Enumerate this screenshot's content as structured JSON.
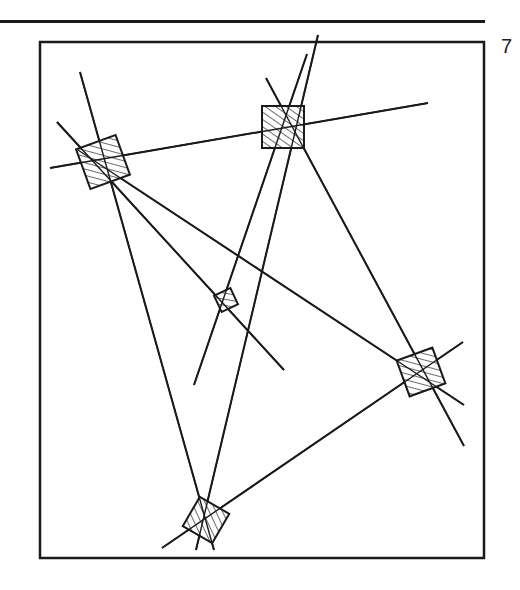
{
  "figure": {
    "number": "7",
    "frame": {
      "x": 40,
      "y": 42,
      "width": 444,
      "height": 516
    },
    "colors": {
      "ink": "#1a1a1a",
      "paper": "#ffffff"
    },
    "nodes": [
      {
        "id": "top-left",
        "cx": 103,
        "cy": 162,
        "size": 42,
        "rotate": -20
      },
      {
        "id": "top-middle",
        "cx": 283,
        "cy": 127,
        "size": 42,
        "rotate": 0
      },
      {
        "id": "center",
        "cx": 226,
        "cy": 300,
        "size": 18,
        "rotate": -25
      },
      {
        "id": "right",
        "cx": 421,
        "cy": 372,
        "size": 38,
        "rotate": -20
      },
      {
        "id": "bottom",
        "cx": 206,
        "cy": 520,
        "size": 34,
        "rotate": 30
      }
    ],
    "lines": [
      [
        50,
        168,
        428,
        103
      ],
      [
        80,
        72,
        214,
        550
      ],
      [
        57,
        122,
        284,
        370
      ],
      [
        78,
        150,
        464,
        405
      ],
      [
        266,
        78,
        464,
        446
      ],
      [
        194,
        385,
        307,
        54
      ],
      [
        196,
        550,
        318,
        35
      ],
      [
        162,
        548,
        463,
        342
      ]
    ]
  }
}
